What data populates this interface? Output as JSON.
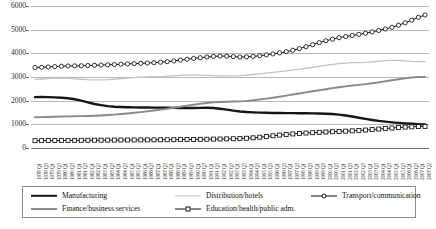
{
  "chart_data": {
    "type": "line",
    "title": "",
    "xlabel": "",
    "ylabel": "",
    "ylim": [
      0,
      6000
    ],
    "ytick_values": [
      0,
      1000,
      2000,
      3000,
      4000,
      5000,
      6000
    ],
    "ytick_labels": [
      "0",
      "1000",
      "2000",
      "3000",
      "4000",
      "5000",
      "6000"
    ],
    "grid": true,
    "legend_position": "bottom",
    "categories": [
      "1978 Q1",
      "1978 Q3",
      "1979 Q1",
      "1979 Q3",
      "1980 Q1",
      "1980 Q3",
      "1981 Q1",
      "1981 Q3",
      "1982 Q1",
      "1982 Q3",
      "1983 Q1",
      "1983 Q3",
      "1984 Q1",
      "1984 Q3",
      "1985 Q1",
      "1985 Q3",
      "1986 Q1",
      "1986 Q3",
      "1987 Q1",
      "1987 Q3",
      "1988 Q1",
      "1988 Q3",
      "1989 Q1",
      "1989 Q3",
      "1990 Q1",
      "1990 Q3",
      "1991 Q1",
      "1991 Q3",
      "1992 Q1",
      "1992 Q3",
      "1993 Q1",
      "1993 Q3",
      "1994 Q1",
      "1994 Q3",
      "1995 Q1",
      "1995 Q3",
      "1996 Q1",
      "1996 Q3",
      "1997 Q1",
      "1997 Q3",
      "1998 Q1",
      "1998 Q3",
      "1999 Q1",
      "1999 Q3",
      "2000 Q1",
      "2000 Q3",
      "2001 Q1",
      "2001 Q3",
      "2002 Q1",
      "2002 Q3",
      "2003 Q1",
      "2003 Q3",
      "2004 Q1",
      "2004 Q3",
      "2005 Q1",
      "2005 Q3",
      "2006 Q1",
      "2006 Q3",
      "2007 Q1",
      "2007 Q2"
    ],
    "series": [
      {
        "name": "Manufacturing",
        "color": "#151515",
        "style": "thick-solid",
        "marker": "none",
        "values": [
          2150,
          2155,
          2150,
          2140,
          2125,
          2100,
          2060,
          2000,
          1930,
          1860,
          1810,
          1770,
          1745,
          1730,
          1720,
          1715,
          1712,
          1710,
          1708,
          1705,
          1700,
          1695,
          1690,
          1688,
          1690,
          1695,
          1700,
          1690,
          1660,
          1620,
          1580,
          1545,
          1520,
          1505,
          1495,
          1488,
          1482,
          1478,
          1475,
          1472,
          1470,
          1468,
          1465,
          1460,
          1450,
          1435,
          1410,
          1375,
          1330,
          1280,
          1230,
          1185,
          1145,
          1112,
          1085,
          1062,
          1042,
          1025,
          1010,
          1000
        ]
      },
      {
        "name": "Distribution/hotels",
        "color": "#c3c3c3",
        "style": "thin-solid",
        "marker": "none",
        "values": [
          2900,
          2915,
          2930,
          2940,
          2945,
          2940,
          2925,
          2905,
          2885,
          2875,
          2875,
          2885,
          2905,
          2930,
          2955,
          2975,
          2990,
          3000,
          3010,
          3020,
          3035,
          3050,
          3065,
          3075,
          3080,
          3078,
          3070,
          3060,
          3050,
          3045,
          3048,
          3060,
          3080,
          3105,
          3135,
          3165,
          3195,
          3225,
          3255,
          3290,
          3330,
          3370,
          3410,
          3450,
          3490,
          3530,
          3565,
          3590,
          3605,
          3610,
          3620,
          3640,
          3665,
          3690,
          3705,
          3700,
          3680,
          3660,
          3650,
          3655
        ]
      },
      {
        "name": "Transport/communication",
        "color": "#111111",
        "style": "marker-line",
        "marker": "open-circle",
        "values": [
          3400,
          3410,
          3425,
          3440,
          3455,
          3465,
          3470,
          3475,
          3485,
          3495,
          3505,
          3515,
          3528,
          3540,
          3552,
          3565,
          3578,
          3590,
          3605,
          3625,
          3650,
          3680,
          3715,
          3750,
          3785,
          3815,
          3845,
          3870,
          3885,
          3880,
          3860,
          3845,
          3850,
          3870,
          3900,
          3935,
          3975,
          4020,
          4070,
          4130,
          4200,
          4280,
          4365,
          4450,
          4530,
          4600,
          4660,
          4710,
          4755,
          4800,
          4850,
          4905,
          4965,
          5030,
          5100,
          5190,
          5290,
          5400,
          5520,
          5620
        ]
      },
      {
        "name": "Finance/business services",
        "color": "#8a8a8a",
        "style": "medium-solid",
        "marker": "none",
        "values": [
          1300,
          1305,
          1312,
          1320,
          1328,
          1335,
          1340,
          1345,
          1352,
          1362,
          1375,
          1392,
          1412,
          1435,
          1460,
          1488,
          1518,
          1550,
          1585,
          1622,
          1660,
          1700,
          1742,
          1785,
          1828,
          1868,
          1902,
          1928,
          1945,
          1955,
          1962,
          1972,
          1990,
          2015,
          2048,
          2085,
          2125,
          2168,
          2212,
          2258,
          2305,
          2352,
          2398,
          2442,
          2485,
          2528,
          2568,
          2605,
          2638,
          2668,
          2700,
          2735,
          2775,
          2818,
          2862,
          2905,
          2945,
          2980,
          3005,
          3000
        ]
      },
      {
        "name": "Education/health/public adm.",
        "color": "#111111",
        "style": "marker-line",
        "marker": "open-square",
        "values": [
          310,
          312,
          314,
          316,
          318,
          320,
          322,
          324,
          326,
          328,
          330,
          332,
          334,
          336,
          338,
          340,
          342,
          344,
          346,
          348,
          350,
          352,
          355,
          358,
          362,
          366,
          370,
          375,
          380,
          386,
          392,
          400,
          412,
          430,
          455,
          485,
          515,
          545,
          572,
          595,
          615,
          632,
          648,
          662,
          675,
          688,
          700,
          712,
          725,
          740,
          758,
          778,
          800,
          822,
          845,
          865,
          882,
          895,
          905,
          912
        ]
      }
    ]
  },
  "legend": {
    "items": [
      {
        "label": "Manufacturing",
        "swatch": "thick-black-line",
        "series_index": 0
      },
      {
        "label": "Distribution/hotels",
        "swatch": "light-gray-line",
        "series_index": 1
      },
      {
        "label": "Transport/communication",
        "swatch": "line-open-circle",
        "series_index": 2
      },
      {
        "label": "Finance/business services",
        "swatch": "medium-gray-line",
        "series_index": 3
      },
      {
        "label": "Education/health/public adm.",
        "swatch": "line-open-square",
        "series_index": 4
      }
    ]
  },
  "colors": {
    "manufacturing": "#151515",
    "distribution": "#c3c3c3",
    "transport": "#111111",
    "finance": "#8a8a8a",
    "education": "#111111",
    "gridline": "#b9b9b9",
    "axis": "#6e6e6e",
    "legend_border": "#8d8d8d"
  }
}
